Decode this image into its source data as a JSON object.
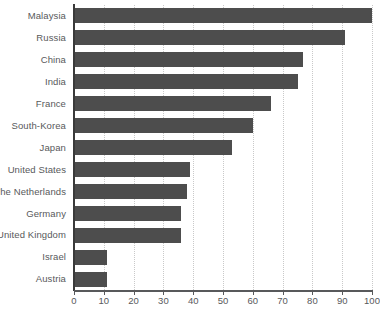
{
  "chart_data": {
    "type": "bar",
    "orientation": "horizontal",
    "title": "",
    "subtitle": "",
    "xlabel": "",
    "ylabel": "",
    "xlim": [
      0,
      100
    ],
    "xticks": [
      0,
      10,
      20,
      30,
      40,
      50,
      60,
      70,
      80,
      90,
      100
    ],
    "xtick_labels": [
      "0",
      "10",
      "20",
      "30",
      "40",
      "50",
      "60",
      "70",
      "80",
      "90",
      "100"
    ],
    "grid": "vertical-dotted",
    "legend": null,
    "bar_color": "#4d4d4d",
    "grid_color": "#c9c9c9",
    "axis_color": "#58595b",
    "categories": [
      "Malaysia",
      "Russia",
      "China",
      "India",
      "France",
      "South-Korea",
      "Japan",
      "United States",
      "The Netherlands",
      "Germany",
      "United Kingdom",
      "Israel",
      "Austria"
    ],
    "values": [
      100,
      91,
      77,
      75,
      66,
      60,
      53,
      39,
      38,
      36,
      36,
      11,
      11
    ]
  }
}
